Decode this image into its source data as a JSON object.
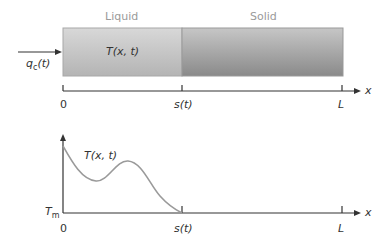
{
  "top_diagram": {
    "region_labels": {
      "liquid": "Liquid",
      "solid": "Solid"
    },
    "field_label": "T(x, t)",
    "flux_label": "q",
    "flux_sub": "c",
    "flux_arg": "(t)",
    "axis": {
      "origin": "0",
      "interface": "s(t)",
      "end": "L",
      "var": "x"
    },
    "colors": {
      "liquid_light": "#d4d4d4",
      "liquid_dark": "#b0b0b0",
      "solid_light": "#c8c8c8",
      "solid_dark": "#8e8e8e",
      "border": "#a0a0a0"
    }
  },
  "bottom_plot": {
    "curve_label": "T(x, t)",
    "y_label": "T",
    "y_sub": "m",
    "axis": {
      "origin": "0",
      "interface": "s(t)",
      "end": "L",
      "var": "x"
    }
  }
}
